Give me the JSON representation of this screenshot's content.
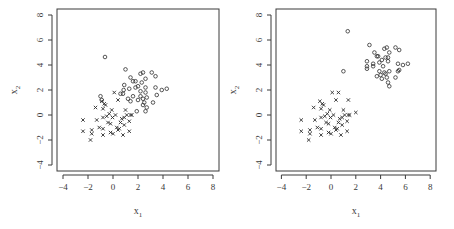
{
  "chart_data": [
    {
      "type": "scatter",
      "title": "",
      "xlabel": "x1",
      "ylabel": "x2",
      "xlim": [
        -4.4,
        8.4
      ],
      "ylim": [
        -4.5,
        8.2
      ],
      "xticks": [
        -4,
        -2,
        0,
        2,
        4,
        6,
        8
      ],
      "yticks": [
        -4,
        -2,
        0,
        2,
        4,
        6,
        8
      ],
      "grid": false,
      "legend": null,
      "series": [
        {
          "name": "class-circle",
          "marker": "circle",
          "points": [
            [
              -0.64,
              4.64
            ],
            [
              1.0,
              3.65
            ],
            [
              1.4,
              3.0
            ],
            [
              1.6,
              2.7
            ],
            [
              1.8,
              2.7
            ],
            [
              2.2,
              3.3
            ],
            [
              2.4,
              3.4
            ],
            [
              3.1,
              3.4
            ],
            [
              3.4,
              3.1
            ],
            [
              2.6,
              2.9
            ],
            [
              2.3,
              2.6
            ],
            [
              0.9,
              2.4
            ],
            [
              0.85,
              2.0
            ],
            [
              0.8,
              1.7
            ],
            [
              0.6,
              1.7
            ],
            [
              1.3,
              2.1
            ],
            [
              1.8,
              2.2
            ],
            [
              2.0,
              2.3
            ],
            [
              2.2,
              1.9
            ],
            [
              2.6,
              2.2
            ],
            [
              2.6,
              1.8
            ],
            [
              3.4,
              2.2
            ],
            [
              3.5,
              1.6
            ],
            [
              3.9,
              2.0
            ],
            [
              4.3,
              2.1
            ],
            [
              1.6,
              1.5
            ],
            [
              2.0,
              1.2
            ],
            [
              2.2,
              1.5
            ],
            [
              2.4,
              1.3
            ],
            [
              2.7,
              1.4
            ],
            [
              1.2,
              1.3
            ],
            [
              1.4,
              1.1
            ],
            [
              2.5,
              1.0
            ],
            [
              2.4,
              0.8
            ],
            [
              3.2,
              1.0
            ],
            [
              2.7,
              0.6
            ],
            [
              2.6,
              0.3
            ],
            [
              1.9,
              0.3
            ],
            [
              -1.0,
              1.5
            ],
            [
              -0.9,
              1.2
            ]
          ]
        },
        {
          "name": "class-cross",
          "marker": "cross",
          "points": [
            [
              -2.4,
              -0.4
            ],
            [
              -2.4,
              -1.3
            ],
            [
              -1.8,
              -2.0
            ],
            [
              -1.7,
              -1.5
            ],
            [
              -1.7,
              -1.2
            ],
            [
              -1.4,
              0.6
            ],
            [
              -1.3,
              -0.4
            ],
            [
              -1.1,
              -1.0
            ],
            [
              -0.8,
              -1.6
            ],
            [
              -0.8,
              -1.1
            ],
            [
              -0.8,
              0.5
            ],
            [
              -0.7,
              0.9
            ],
            [
              -0.6,
              0.8
            ],
            [
              -0.8,
              -0.2
            ],
            [
              -0.5,
              -0.1
            ],
            [
              -0.3,
              0.1
            ],
            [
              -0.4,
              -0.6
            ],
            [
              -0.2,
              -0.7
            ],
            [
              -0.2,
              -1.4
            ],
            [
              0.0,
              -1.5
            ],
            [
              -0.1,
              0.4
            ],
            [
              -0.04,
              -0.2
            ],
            [
              0.2,
              0.0
            ],
            [
              0.1,
              1.8
            ],
            [
              0.4,
              1.2
            ],
            [
              0.3,
              -1.0
            ],
            [
              0.4,
              -1.2
            ],
            [
              0.5,
              -1.1
            ],
            [
              0.6,
              -0.6
            ],
            [
              0.7,
              -0.3
            ],
            [
              0.9,
              -0.2
            ],
            [
              0.8,
              -1.6
            ],
            [
              0.9,
              -0.8
            ],
            [
              1.0,
              0.4
            ],
            [
              1.1,
              0.0
            ],
            [
              1.3,
              -1.3
            ],
            [
              1.3,
              -0.5
            ],
            [
              1.5,
              0.0
            ],
            [
              1.4,
              0.0
            ],
            [
              -0.9,
              1.1
            ]
          ]
        }
      ]
    },
    {
      "type": "scatter",
      "title": "",
      "xlabel": "x1",
      "ylabel": "x2",
      "xlim": [
        -4.4,
        8.4
      ],
      "ylim": [
        -4.5,
        8.2
      ],
      "xticks": [
        -4,
        -2,
        0,
        2,
        4,
        6,
        8
      ],
      "yticks": [
        -4,
        -2,
        0,
        2,
        4,
        6,
        8
      ],
      "grid": false,
      "legend": null,
      "series": [
        {
          "name": "class-circle",
          "marker": "circle",
          "points": [
            [
              1.35,
              6.7
            ],
            [
              1.0,
              3.5
            ],
            [
              3.1,
              5.6
            ],
            [
              3.5,
              5.0
            ],
            [
              3.7,
              4.7
            ],
            [
              2.9,
              4.3
            ],
            [
              2.9,
              3.9
            ],
            [
              2.9,
              3.7
            ],
            [
              3.4,
              4.1
            ],
            [
              3.4,
              3.9
            ],
            [
              3.8,
              4.7
            ],
            [
              3.9,
              4.2
            ],
            [
              4.1,
              4.4
            ],
            [
              4.2,
              3.9
            ],
            [
              4.3,
              5.3
            ],
            [
              4.5,
              5.4
            ],
            [
              4.4,
              4.6
            ],
            [
              4.6,
              4.3
            ],
            [
              4.7,
              5.0
            ],
            [
              5.2,
              5.4
            ],
            [
              5.5,
              5.2
            ],
            [
              4.3,
              3.4
            ],
            [
              4.4,
              3.3
            ],
            [
              4.5,
              3.0
            ],
            [
              4.7,
              3.5
            ],
            [
              4.6,
              2.6
            ],
            [
              4.7,
              2.3
            ],
            [
              5.2,
              3.0
            ],
            [
              5.4,
              3.5
            ],
            [
              5.4,
              4.1
            ],
            [
              5.8,
              4.0
            ],
            [
              6.2,
              4.1
            ],
            [
              3.7,
              3.1
            ],
            [
              3.9,
              3.5
            ],
            [
              4.0,
              3.2
            ],
            [
              4.1,
              2.9
            ],
            [
              4.6,
              4.6
            ],
            [
              5.5,
              3.6
            ]
          ]
        },
        {
          "name": "class-cross",
          "marker": "cross",
          "points": [
            [
              -2.4,
              -0.4
            ],
            [
              -2.4,
              -1.3
            ],
            [
              -1.8,
              -2.0
            ],
            [
              -1.7,
              -1.5
            ],
            [
              -1.7,
              -1.2
            ],
            [
              -1.4,
              0.6
            ],
            [
              -1.3,
              -0.4
            ],
            [
              -1.1,
              -1.0
            ],
            [
              -0.8,
              -1.6
            ],
            [
              -0.8,
              -1.1
            ],
            [
              -0.8,
              0.5
            ],
            [
              -0.7,
              0.9
            ],
            [
              -0.6,
              0.8
            ],
            [
              -0.8,
              -0.2
            ],
            [
              -0.5,
              -0.1
            ],
            [
              -0.3,
              0.1
            ],
            [
              -0.4,
              -0.6
            ],
            [
              -0.2,
              -0.7
            ],
            [
              -0.2,
              -1.4
            ],
            [
              0.0,
              -1.5
            ],
            [
              -0.1,
              0.4
            ],
            [
              -0.04,
              -0.2
            ],
            [
              0.2,
              0.0
            ],
            [
              0.1,
              1.8
            ],
            [
              0.4,
              1.2
            ],
            [
              0.3,
              -1.0
            ],
            [
              0.4,
              -1.2
            ],
            [
              0.5,
              -1.1
            ],
            [
              0.6,
              -0.6
            ],
            [
              0.7,
              -0.3
            ],
            [
              0.9,
              -0.2
            ],
            [
              0.8,
              -1.6
            ],
            [
              0.9,
              -0.8
            ],
            [
              1.0,
              0.4
            ],
            [
              1.1,
              0.0
            ],
            [
              1.3,
              -1.3
            ],
            [
              1.3,
              -0.5
            ],
            [
              1.5,
              0.0
            ],
            [
              1.4,
              0.0
            ],
            [
              -0.9,
              1.1
            ],
            [
              0.6,
              1.8
            ],
            [
              1.4,
              1.2
            ],
            [
              2.0,
              0.2
            ]
          ]
        }
      ]
    }
  ],
  "panels": [
    {
      "xlabel_main": "x",
      "xlabel_sub": "1",
      "ylabel_main": "x",
      "ylabel_sub": "2"
    },
    {
      "xlabel_main": "x",
      "xlabel_sub": "1",
      "ylabel_main": "x",
      "ylabel_sub": "2"
    }
  ],
  "colors": {
    "axis": "#3a3a3a",
    "marker": "#2e2e2e",
    "background": "#ffffff"
  }
}
